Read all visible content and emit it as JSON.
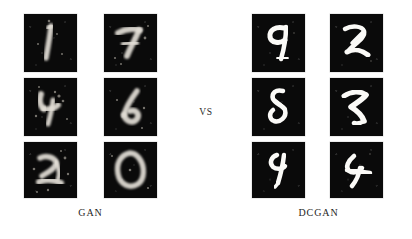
{
  "figure": {
    "type": "comparison-sample-grid",
    "background_color": "#ffffff",
    "separator_label": "VS",
    "tile_background_color": "#0a0a0a",
    "stroke_color": "#f4f2ee"
  },
  "groups": [
    {
      "id": "gan",
      "caption": "GAN",
      "columns": 2,
      "rows": 3,
      "quality": "noisy",
      "samples": [
        {
          "digit": "1",
          "position": "row1-col1"
        },
        {
          "digit": "7",
          "position": "row1-col2"
        },
        {
          "digit": "4",
          "position": "row2-col1"
        },
        {
          "digit": "6",
          "position": "row2-col2"
        },
        {
          "digit": "2",
          "position": "row3-col1"
        },
        {
          "digit": "0",
          "position": "row3-col2"
        }
      ]
    },
    {
      "id": "dcgan",
      "caption": "DCGAN",
      "columns": 2,
      "rows": 3,
      "quality": "clean",
      "samples": [
        {
          "digit": "9",
          "position": "row1-col1"
        },
        {
          "digit": "2",
          "position": "row1-col2"
        },
        {
          "digit": "8",
          "position": "row2-col1"
        },
        {
          "digit": "7",
          "position": "row2-col2"
        },
        {
          "digit": "4",
          "position": "row3-col1"
        },
        {
          "digit": "4",
          "position": "row3-col2"
        }
      ]
    }
  ],
  "captions": {
    "left": "GAN",
    "right": "DCGAN"
  }
}
